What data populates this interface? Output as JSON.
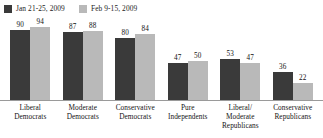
{
  "legend": {
    "position": "top-left",
    "items": [
      {
        "label": "Jan 21-25, 2009",
        "color": "#3a3a3a",
        "swatch_name": "legend-swatch-dark"
      },
      {
        "label": "Feb 9-15, 2009",
        "color": "#b9b9b9",
        "swatch_name": "legend-swatch-light"
      }
    ]
  },
  "chart_data": {
    "type": "bar",
    "title": "",
    "subtitle": "",
    "xlabel": "",
    "ylabel": "",
    "ylim": [
      0,
      100
    ],
    "grid": false,
    "legend_position": "top-left",
    "categories": [
      "Liberal Democrats",
      "Moderate Democrats",
      "Conservative Democrats",
      "Pure Independents",
      "Liberal/ Moderate Republicans",
      "Conservative Republicans"
    ],
    "category_lines": [
      [
        "Liberal",
        "Democrats"
      ],
      [
        "Moderate",
        "Democrats"
      ],
      [
        "Conservative",
        "Democrats"
      ],
      [
        "Pure",
        "Independents"
      ],
      [
        "Liberal/",
        "Moderate",
        "Republicans"
      ],
      [
        "Conservative",
        "Republicans"
      ]
    ],
    "series": [
      {
        "name": "Jan 21-25, 2009",
        "color": "#3a3a3a",
        "values": [
          90,
          87,
          80,
          47,
          53,
          36
        ]
      },
      {
        "name": "Feb 9-15, 2009",
        "color": "#b9b9b9",
        "values": [
          94,
          88,
          84,
          50,
          47,
          22
        ]
      }
    ]
  },
  "axis": {
    "baseline_color": "#9a9a9a"
  }
}
